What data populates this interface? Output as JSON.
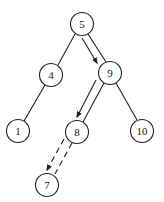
{
  "diagram": {
    "type": "binary-search-tree",
    "nodes": [
      {
        "id": "n5",
        "label": "5",
        "x": 82,
        "y": 24
      },
      {
        "id": "n4",
        "label": "4",
        "x": 51,
        "y": 75
      },
      {
        "id": "n9",
        "label": "9",
        "x": 110,
        "y": 73
      },
      {
        "id": "n1",
        "label": "1",
        "x": 18,
        "y": 131
      },
      {
        "id": "n8",
        "label": "8",
        "x": 77,
        "y": 132
      },
      {
        "id": "n10",
        "label": "10",
        "x": 142,
        "y": 131
      },
      {
        "id": "n7",
        "label": "7",
        "x": 47,
        "y": 185
      }
    ],
    "edges": [
      {
        "from": "5",
        "to": "4",
        "style": "solid"
      },
      {
        "from": "5",
        "to": "9",
        "style": "solid"
      },
      {
        "from": "4",
        "to": "1",
        "style": "solid"
      },
      {
        "from": "9",
        "to": "8",
        "style": "solid"
      },
      {
        "from": "9",
        "to": "10",
        "style": "solid"
      },
      {
        "from": "8",
        "to": "7",
        "style": "dashed"
      }
    ],
    "search_path_arrows": [
      {
        "from": "5",
        "to": "9",
        "style": "solid"
      },
      {
        "from": "9",
        "to": "8",
        "style": "solid"
      },
      {
        "from": "8",
        "to": "7",
        "style": "dashed"
      }
    ],
    "colors": {
      "stroke": "#222222",
      "fill": "#ffffff",
      "background": "#ffffff"
    }
  }
}
